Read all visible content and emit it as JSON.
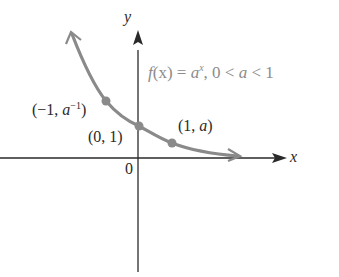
{
  "diagram": {
    "function_label": {
      "f": "f",
      "arg": "(x)",
      "eq": " = ",
      "base": "a",
      "exp": "x",
      "cond": ", 0 < ",
      "var": "a",
      "cond2": " < 1"
    },
    "axes": {
      "x_label": "x",
      "y_label": "y",
      "origin_label": "0"
    },
    "points": [
      {
        "label_open": "(−1, ",
        "label_var": "a",
        "label_sup": "−1",
        "label_close": ")"
      },
      {
        "label": "(0, 1)"
      },
      {
        "label_open": "(1, ",
        "label_var": "a",
        "label_close": ")"
      }
    ],
    "colors": {
      "curve": "#8a8a8a",
      "axis": "#2a2a2a",
      "text": "#2a2a2a",
      "function_text": "#8c8c8c"
    }
  }
}
